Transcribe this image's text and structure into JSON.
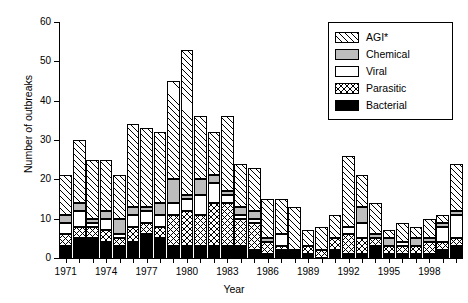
{
  "chart_data": {
    "type": "bar",
    "subtype": "stacked-bar",
    "title": "",
    "xlabel": "Year",
    "ylabel": "Number of outbreaks",
    "ylim": [
      0,
      60
    ],
    "ytick_values": [
      0,
      10,
      20,
      30,
      40,
      50,
      60
    ],
    "ytick_labels": [
      "0",
      "10",
      "20",
      "30",
      "40",
      "50",
      "60"
    ],
    "grid": false,
    "legend_position": "top-right",
    "categories": [
      "1971",
      "1972",
      "1973",
      "1974",
      "1975",
      "1976",
      "1977",
      "1978",
      "1979",
      "1980",
      "1981",
      "1982",
      "1983",
      "1984",
      "1985",
      "1986",
      "1987",
      "1988",
      "1989",
      "1990",
      "1991",
      "1992",
      "1993",
      "1994",
      "1995",
      "1996",
      "1997",
      "1998",
      "1999",
      "2000"
    ],
    "xtick_labels": [
      "1971",
      "1974",
      "1977",
      "1980",
      "1983",
      "1986",
      "1989",
      "1992",
      "1995",
      "1998"
    ],
    "xtick_categories": [
      "1971",
      "1974",
      "1977",
      "1980",
      "1983",
      "1986",
      "1989",
      "1992",
      "1995",
      "1998"
    ],
    "series": [
      {
        "name": "Bacterial",
        "fill": "bacterial",
        "values": [
          3,
          5,
          5,
          4,
          3,
          4,
          6,
          5,
          3,
          3,
          3,
          3,
          3,
          3,
          2,
          1,
          2,
          2,
          1,
          0,
          2,
          1,
          1,
          3,
          1,
          1,
          1,
          1,
          2,
          3
        ]
      },
      {
        "name": "Parasitic",
        "fill": "parasitic",
        "values": [
          3,
          3,
          3,
          3,
          2,
          4,
          3,
          3,
          8,
          9,
          8,
          11,
          11,
          7,
          7,
          3,
          1,
          0,
          2,
          2,
          3,
          5,
          4,
          2,
          2,
          2,
          2,
          3,
          2,
          2
        ]
      },
      {
        "name": "Viral",
        "fill": "viral",
        "values": [
          3,
          4,
          1,
          3,
          1,
          3,
          3,
          3,
          3,
          3,
          5,
          5,
          2,
          1,
          1,
          0,
          3,
          0,
          0,
          0,
          0,
          2,
          4,
          0,
          0,
          1,
          0,
          0,
          4,
          6
        ]
      },
      {
        "name": "Chemical",
        "fill": "chemical",
        "values": [
          2,
          2,
          1,
          2,
          4,
          2,
          1,
          3,
          6,
          1,
          4,
          2,
          1,
          2,
          2,
          1,
          0,
          0,
          0,
          0,
          0,
          0,
          4,
          1,
          2,
          0,
          2,
          1,
          1,
          1
        ]
      },
      {
        "name": "AGI*",
        "fill": "agi",
        "values": [
          10,
          16,
          15,
          13,
          11,
          21,
          20,
          18,
          25,
          37,
          16,
          11,
          19,
          11,
          11,
          10,
          9,
          11,
          4,
          6,
          6,
          18,
          8,
          8,
          2,
          5,
          3,
          5,
          2,
          12
        ]
      }
    ],
    "totals": [
      21,
      30,
      25,
      25,
      21,
      34,
      33,
      32,
      45,
      53,
      36,
      32,
      36,
      24,
      23,
      15,
      15,
      13,
      7,
      8,
      11,
      26,
      21,
      14,
      7,
      9,
      8,
      10,
      11,
      24
    ],
    "legend_entries": [
      {
        "label": "AGI*",
        "fill": "agi"
      },
      {
        "label": "Chemical",
        "fill": "chemical"
      },
      {
        "label": "Viral",
        "fill": "viral"
      },
      {
        "label": "Parasitic",
        "fill": "parasitic"
      },
      {
        "label": "Bacterial",
        "fill": "bacterial"
      }
    ],
    "colors": {
      "chemical": "#bdbdbd",
      "bacterial": "#000000",
      "viral": "#ffffff",
      "axis": "#000000"
    }
  }
}
